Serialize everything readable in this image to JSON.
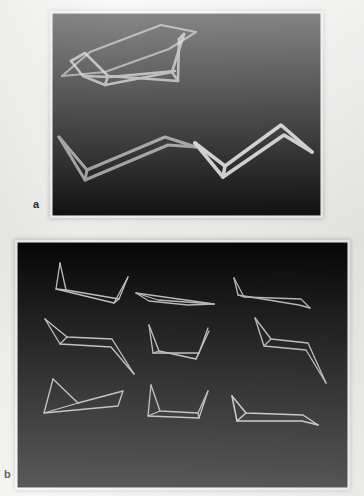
{
  "figure": {
    "background_color": "#f2f2f0",
    "panel_background_color": "#050505",
    "stroke_color": "#d8d8d4",
    "panels": [
      {
        "id": "a",
        "label": "a",
        "x": 53,
        "y": 14,
        "width": 267,
        "height": 201,
        "viewbox": "0 0 267 201",
        "rows": 2,
        "cols": 2,
        "shape_count": 4,
        "shapes": [
          {
            "name": "shape-a-1",
            "description": "open zigzag wireframe, upward tips left and right",
            "stroke_width": 2.6,
            "opacity": 0.72,
            "polylines": [
              "18,47 32,39 55,62 125,67 126,25",
              "18,47 30,62 52,71 119,58 131,20",
              "30,62 57,63 122,57",
              "55,62 52,71",
              "126,25 131,20",
              "125,67 119,58",
              "18,47 18,47"
            ]
          },
          {
            "name": "shape-a-2",
            "description": "thin elongated sliver / flattened lens wireframe",
            "stroke_width": 2.2,
            "opacity": 0.62,
            "polylines": [
              "9,62 37,38 108,11 143,18",
              "9,62 52,58 116,35 143,18"
            ]
          },
          {
            "name": "shape-a-3",
            "description": "flat zigzag wireframe, lower-left group",
            "stroke_width": 3.0,
            "opacity": 0.68,
            "polylines": [
              "6,123 34,156 112,123 143,133",
              "6,123 32,166 115,131 143,133",
              "34,156 32,166"
            ]
          },
          {
            "name": "shape-a-4",
            "description": "bold zigzag wireframe, lower-right group",
            "stroke_width": 3.6,
            "opacity": 0.96,
            "polylines": [
              "142,129 172,152 228,111 259,138",
              "142,129 170,163 231,121 259,138",
              "172,152 170,163"
            ]
          }
        ]
      },
      {
        "id": "b",
        "label": "b",
        "x": 18,
        "y": 243,
        "width": 329,
        "height": 244,
        "viewbox": "0 0 329 244",
        "rows": 3,
        "cols": 3,
        "shape_count": 9,
        "shapes": [
          {
            "name": "shape-b-1",
            "description": "row 1 col 1 — tall left spike, long flat body, right spike",
            "stroke_width": 1.3,
            "opacity": 0.88,
            "polylines": [
              "42,20 48,47 101,56 110,34",
              "42,20 38,46 96,60 110,34",
              "38,46 48,47",
              "96,60 101,56"
            ]
          },
          {
            "name": "shape-b-2",
            "description": "row 1 col 2 — thin elongated sliver, nearly flat",
            "stroke_width": 1.3,
            "opacity": 0.85,
            "polylines": [
              "118,50 196,61",
              "118,50 140,57 196,61",
              "118,50 131,58 170,62 196,61"
            ]
          },
          {
            "name": "shape-b-3",
            "description": "row 1 col 3 — left spike with long shallow body to the right",
            "stroke_width": 1.3,
            "opacity": 0.85,
            "polylines": [
              "216,35 226,54 283,56 292,65",
              "216,35 220,52 281,62 292,65",
              "220,52 226,54"
            ]
          },
          {
            "name": "shape-b-4",
            "description": "row 2 col 1 — left spike, body, descending right tail",
            "stroke_width": 1.3,
            "opacity": 0.88,
            "polylines": [
              "27,76 49,94 94,96 116,131",
              "27,76 42,101 93,104 116,131",
              "42,101 49,94"
            ]
          },
          {
            "name": "shape-b-5",
            "description": "row 2 col 2 — wide U / bowl shape with two upward tips",
            "stroke_width": 1.3,
            "opacity": 0.88,
            "polylines": [
              "131,82 141,108 178,116 191,88",
              "131,82 135,110 181,110 190,85",
              "135,110 141,108",
              "178,116 181,110"
            ]
          },
          {
            "name": "shape-b-6",
            "description": "row 2 col 3 — left spike, body, long descending right tail",
            "stroke_width": 1.3,
            "opacity": 0.88,
            "polylines": [
              "237,75 253,96 290,100 308,140",
              "237,75 246,103 288,107 308,140",
              "246,103 253,96"
            ]
          },
          {
            "name": "shape-b-7",
            "description": "row 3 col 1 — tall narrow left triangle, flat base, right tip",
            "stroke_width": 1.3,
            "opacity": 0.85,
            "polylines": [
              "35,136 60,160 105,148",
              "35,136 26,170 100,163 105,148",
              "26,170 60,160"
            ]
          },
          {
            "name": "shape-b-8",
            "description": "row 3 col 2 — left spike, flat base, short right tip",
            "stroke_width": 1.3,
            "opacity": 0.85,
            "polylines": [
              "133,142 142,168 180,170 190,148",
              "133,142 130,173 181,175 190,148",
              "130,173 142,168",
              "180,170 181,175"
            ]
          },
          {
            "name": "shape-b-9",
            "description": "row 3 col 3 — left spike with long flat tapering body to the right",
            "stroke_width": 1.5,
            "opacity": 0.92,
            "polylines": [
              "214,153 228,170 285,172 300,182",
              "214,153 219,178 284,178 300,182",
              "219,178 228,170"
            ]
          }
        ]
      }
    ]
  }
}
